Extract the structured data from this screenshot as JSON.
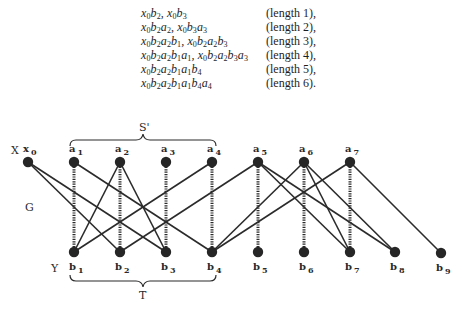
{
  "paths": [
    {
      "expr": [
        [
          "x",
          "0"
        ],
        [
          "b",
          "2"
        ],
        [
          ", ",
          ""
        ],
        [
          "x",
          "0"
        ],
        [
          "b",
          "3"
        ]
      ],
      "length_label": "(length 1),"
    },
    {
      "expr": [
        [
          "x",
          "0"
        ],
        [
          "b",
          "2"
        ],
        [
          "a",
          "2"
        ],
        [
          ", ",
          ""
        ],
        [
          "x",
          "0"
        ],
        [
          "b",
          "3"
        ],
        [
          "a",
          "3"
        ]
      ],
      "length_label": "(length 2),"
    },
    {
      "expr": [
        [
          "x",
          "0"
        ],
        [
          "b",
          "2"
        ],
        [
          "a",
          "2"
        ],
        [
          "b",
          "1"
        ],
        [
          ", ",
          ""
        ],
        [
          "x",
          "0"
        ],
        [
          "b",
          "2"
        ],
        [
          "a",
          "2"
        ],
        [
          "b",
          "3"
        ]
      ],
      "length_label": "(length 3),"
    },
    {
      "expr": [
        [
          "x",
          "0"
        ],
        [
          "b",
          "2"
        ],
        [
          "a",
          "2"
        ],
        [
          "b",
          "1"
        ],
        [
          "a",
          "1"
        ],
        [
          ", ",
          ""
        ],
        [
          "x",
          "0"
        ],
        [
          "b",
          "2"
        ],
        [
          "a",
          "2"
        ],
        [
          "b",
          "3"
        ],
        [
          "a",
          "3"
        ]
      ],
      "length_label": "(length 4),"
    },
    {
      "expr": [
        [
          "x",
          "0"
        ],
        [
          "b",
          "2"
        ],
        [
          "a",
          "2"
        ],
        [
          "b",
          "1"
        ],
        [
          "a",
          "1"
        ],
        [
          "b",
          "4"
        ]
      ],
      "length_label": "(length 5),"
    },
    {
      "expr": [
        [
          "x",
          "0"
        ],
        [
          "b",
          "2"
        ],
        [
          "a",
          "2"
        ],
        [
          "b",
          "1"
        ],
        [
          "a",
          "1"
        ],
        [
          "b",
          "4"
        ],
        [
          "a",
          "4"
        ]
      ],
      "length_label": "(length 6)."
    }
  ],
  "graph": {
    "labels": {
      "X": "X",
      "Y": "Y",
      "G": "G",
      "S_prime": "S'",
      "T": "T"
    },
    "top_vertices": [
      {
        "id": "x0",
        "name": "x",
        "sub": "0",
        "x": 28,
        "y": 162
      },
      {
        "id": "a1",
        "name": "a",
        "sub": "1",
        "x": 74,
        "y": 162
      },
      {
        "id": "a2",
        "name": "a",
        "sub": "2",
        "x": 120,
        "y": 162
      },
      {
        "id": "a3",
        "name": "a",
        "sub": "3",
        "x": 166,
        "y": 162
      },
      {
        "id": "a4",
        "name": "a",
        "sub": "4",
        "x": 212,
        "y": 162
      },
      {
        "id": "a5",
        "name": "a",
        "sub": "5",
        "x": 258,
        "y": 162
      },
      {
        "id": "a6",
        "name": "a",
        "sub": "6",
        "x": 304,
        "y": 162
      },
      {
        "id": "a7",
        "name": "a",
        "sub": "7",
        "x": 350,
        "y": 162
      }
    ],
    "bottom_vertices": [
      {
        "id": "b1",
        "name": "b",
        "sub": "1",
        "x": 74,
        "y": 252
      },
      {
        "id": "b2",
        "name": "b",
        "sub": "2",
        "x": 120,
        "y": 252
      },
      {
        "id": "b3",
        "name": "b",
        "sub": "3",
        "x": 166,
        "y": 252
      },
      {
        "id": "b4",
        "name": "b",
        "sub": "4",
        "x": 212,
        "y": 252
      },
      {
        "id": "b5",
        "name": "b",
        "sub": "5",
        "x": 258,
        "y": 252
      },
      {
        "id": "b6",
        "name": "b",
        "sub": "6",
        "x": 304,
        "y": 252
      },
      {
        "id": "b7",
        "name": "b",
        "sub": "7",
        "x": 350,
        "y": 252
      },
      {
        "id": "b8",
        "name": "b",
        "sub": "8",
        "x": 395,
        "y": 252
      },
      {
        "id": "b9",
        "name": "b",
        "sub": "9",
        "x": 441,
        "y": 253
      }
    ],
    "solid_edges": [
      [
        "x0",
        "b2"
      ],
      [
        "x0",
        "b3"
      ],
      [
        "a1",
        "b4"
      ],
      [
        "a2",
        "b1"
      ],
      [
        "a2",
        "b3"
      ],
      [
        "a4",
        "b1"
      ],
      [
        "a5",
        "b2"
      ],
      [
        "a5",
        "b7"
      ],
      [
        "a5",
        "b8"
      ],
      [
        "a6",
        "b4"
      ],
      [
        "a6",
        "b7"
      ],
      [
        "a6",
        "b8"
      ],
      [
        "a7",
        "b4"
      ],
      [
        "a7",
        "b9"
      ]
    ],
    "matching_edges": [
      [
        "a1",
        "b1"
      ],
      [
        "a2",
        "b2"
      ],
      [
        "a3",
        "b3"
      ],
      [
        "a4",
        "b4"
      ],
      [
        "a5",
        "b5"
      ],
      [
        "a6",
        "b6"
      ],
      [
        "a7",
        "b7"
      ]
    ],
    "colors": {
      "edge": "#2b2b2b",
      "vertex": "#262626"
    }
  }
}
